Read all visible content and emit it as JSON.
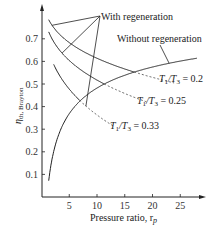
{
  "chart_data": {
    "type": "line",
    "title": "",
    "xlabel": "Pressure ratio, r",
    "xlabel_subscript": "p",
    "ylabel": "η",
    "ylabel_subscript": "th, Brayton",
    "xlim": [
      0,
      29
    ],
    "ylim": [
      0,
      0.8
    ],
    "grid": false,
    "x_ticks": [
      5,
      10,
      15,
      20,
      25
    ],
    "x_tick_labels": [
      "5",
      "10",
      "15",
      "20",
      "25"
    ],
    "y_ticks": [
      0.1,
      0.2,
      0.3,
      0.4,
      0.5,
      0.6,
      0.7
    ],
    "y_tick_labels": [
      "0.1",
      "0.2",
      "0.3",
      "0.4",
      "0.5",
      "0.6",
      "0.7"
    ],
    "gamma_exponent": 0.2857,
    "series": [
      {
        "name": "Without regeneration",
        "formula": "1 - rp^(-0.2857)",
        "x": [
          1.3,
          2,
          3,
          4,
          5,
          6,
          8,
          10,
          12,
          15,
          18,
          21,
          24,
          28
        ],
        "y": [
          0.072,
          0.18,
          0.27,
          0.327,
          0.369,
          0.401,
          0.448,
          0.482,
          0.508,
          0.539,
          0.562,
          0.581,
          0.597,
          0.614
        ],
        "style": "solid"
      },
      {
        "name": "With regeneration, T1/T3 = 0.2",
        "ratio": 0.2,
        "x_start": 1.3,
        "x_intersect": 16.7,
        "x_end": 24,
        "y_at_intersect": 0.553,
        "style": "solid-then-dashed"
      },
      {
        "name": "With regeneration, T1/T3 = 0.25",
        "ratio": 0.25,
        "x_start": 1.3,
        "x_intersect": 11.3,
        "x_end": 19,
        "y_at_intersect": 0.5,
        "style": "solid-then-dashed"
      },
      {
        "name": "With regeneration, T1/T3 = 0.33",
        "ratio": 0.33,
        "x_start": 2.2,
        "x_intersect": 6.85,
        "x_end": 13,
        "y_at_intersect": 0.42,
        "style": "solid-then-dashed"
      }
    ],
    "annotations": {
      "with_regen": "With regeneration",
      "without_regen": "Without regeneration",
      "ratio_labels": [
        {
          "prefix": "T",
          "sub1": "1",
          "mid": "/T",
          "sub2": "3",
          "value": " = 0.2"
        },
        {
          "prefix": "T",
          "sub1": "1",
          "mid": "/T",
          "sub2": "3",
          "value": " = 0.25"
        },
        {
          "prefix": "T",
          "sub1": "1",
          "mid": "/T",
          "sub2": "3",
          "value": " = 0.33"
        }
      ]
    }
  }
}
